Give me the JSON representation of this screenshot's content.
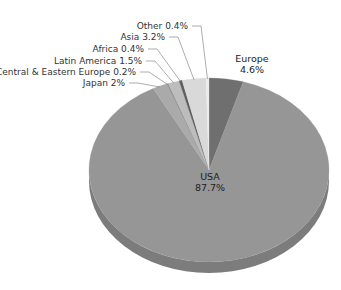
{
  "chart_data": {
    "type": "pie",
    "style": "3d-tilted",
    "title": "",
    "start_angle_deg": 0,
    "direction": "clockwise",
    "slices": [
      {
        "label": "Europe",
        "value": 4.6,
        "display": "4.6%",
        "color": "#6f6f6f",
        "label_pos": "outside-inline"
      },
      {
        "label": "USA",
        "value": 87.7,
        "display": "87.7%",
        "color": "#969696",
        "label_pos": "inside"
      },
      {
        "label": "Japan",
        "value": 2.0,
        "display": "2%",
        "color": "#aaaaaa",
        "label_pos": "callout"
      },
      {
        "label": "Central & Eastern Europe",
        "value": 0.2,
        "display": "0.2%",
        "color": "#8a8a8a",
        "label_pos": "callout"
      },
      {
        "label": "Latin America",
        "value": 1.5,
        "display": "1.5%",
        "color": "#bdbdbd",
        "label_pos": "callout"
      },
      {
        "label": "Africa",
        "value": 0.4,
        "display": "0.4%",
        "color": "#5e5e5e",
        "label_pos": "callout"
      },
      {
        "label": "Asia",
        "value": 3.2,
        "display": "3.2%",
        "color": "#d9d9d9",
        "label_pos": "callout"
      },
      {
        "label": "Other",
        "value": 0.4,
        "display": "0.4%",
        "color": "#ececec",
        "label_pos": "callout"
      }
    ],
    "legend": "none"
  },
  "labels": {
    "europe_name": "Europe",
    "europe_value": "4.6%",
    "usa_name": "USA",
    "usa_value": "87.7%",
    "callouts": [
      {
        "text": "Other 0.4%",
        "slice": "Other"
      },
      {
        "text": "Asia 3.2%",
        "slice": "Asia"
      },
      {
        "text": "Africa 0.4%",
        "slice": "Africa"
      },
      {
        "text": "Latin America 1.5%",
        "slice": "Latin America"
      },
      {
        "text": "Central & Eastern Europe 0.2%",
        "slice": "Central & Eastern Europe"
      },
      {
        "text": "Japan 2%",
        "slice": "Japan"
      }
    ]
  },
  "colors": {
    "depth_side": "#7c7c7c",
    "leader_line": "#777777",
    "text": "#333333"
  }
}
